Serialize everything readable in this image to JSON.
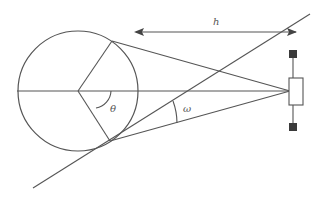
{
  "diagram": {
    "type": "geometry",
    "colors": {
      "stroke": "#555555",
      "sensor_marker_fill": "#3a3a3a",
      "background": "#ffffff"
    },
    "labels": {
      "distance": "h",
      "center_angle": "θ",
      "tangent_angle": "ω"
    },
    "elements": [
      {
        "name": "circle",
        "cx": 78,
        "cy": 91,
        "r": 60
      },
      {
        "name": "horizontal-axis",
        "from": [
          18,
          91
        ],
        "to": [
          290,
          91
        ]
      },
      {
        "name": "upper-tangent-line",
        "from": [
          112,
          41
        ],
        "to": [
          290,
          91
        ]
      },
      {
        "name": "lower-tangent-line",
        "from": [
          110,
          141
        ],
        "to": [
          290,
          91
        ]
      },
      {
        "name": "upper-radius",
        "from": [
          78,
          91
        ],
        "to": [
          112,
          41
        ]
      },
      {
        "name": "lower-radius",
        "from": [
          78,
          91
        ],
        "to": [
          110,
          141
        ]
      },
      {
        "name": "diagonal-line",
        "from": [
          33,
          188
        ],
        "to": [
          310,
          14
        ]
      },
      {
        "name": "distance-arrow-h",
        "from": [
          134,
          32
        ],
        "to": [
          298,
          32
        ]
      },
      {
        "name": "sensor-body",
        "x": 289,
        "y": 78,
        "w": 14,
        "h": 27
      },
      {
        "name": "sensor-top-marker",
        "x": 289,
        "y": 52,
        "w": 8,
        "h": 8
      },
      {
        "name": "sensor-bottom-marker",
        "x": 289,
        "y": 123,
        "w": 8,
        "h": 8
      }
    ]
  }
}
